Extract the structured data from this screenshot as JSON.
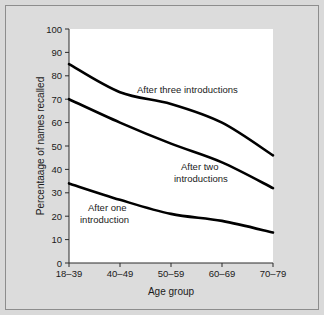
{
  "figure": {
    "background_color": "#d9d9d9",
    "plot_background_color": "#ffffff",
    "border_color": "#8d8d8d",
    "line_color": "#000000"
  },
  "chart_data": {
    "type": "line",
    "title": "",
    "xlabel": "Age group",
    "ylabel": "Percentaage of names recalled",
    "categories": [
      "18–39",
      "40–49",
      "50–59",
      "60–69",
      "70–79"
    ],
    "ylim": [
      0,
      100
    ],
    "yticks": [
      0,
      10,
      20,
      30,
      40,
      50,
      60,
      70,
      80,
      90,
      100
    ],
    "ytick_labels": [
      "0",
      "10",
      "20",
      "30",
      "40",
      "50",
      "60",
      "70",
      "80",
      "90",
      "100"
    ],
    "grid": false,
    "legend_position": "inline-annotations",
    "series": [
      {
        "name": "After three introductions",
        "label_text": "After three introductions",
        "values": [
          85,
          73,
          68,
          60,
          46
        ]
      },
      {
        "name": "After two introductions",
        "label_text": "After two\nintroductions",
        "label_line_1": "After two",
        "label_line_2": "introductions",
        "values": [
          70,
          60,
          51,
          43,
          32
        ]
      },
      {
        "name": "After one introduction",
        "label_text": "After one\nintroduction",
        "label_line_1": "After one",
        "label_line_2": "introduction",
        "values": [
          34,
          27,
          21,
          18,
          13
        ]
      }
    ]
  }
}
